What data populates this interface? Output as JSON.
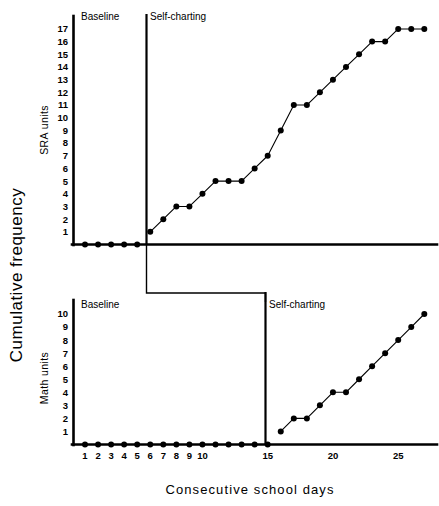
{
  "chart_data": {
    "type": "line",
    "title": "",
    "xlabel": "Consecutive school days",
    "ylabel": "Cumulative frequency",
    "grid": false,
    "legend": "none",
    "design": "multiple-baseline across behaviors (AB design)",
    "xlim": [
      0.3,
      27.8
    ],
    "xticks": [
      1,
      2,
      3,
      4,
      5,
      6,
      7,
      8,
      9,
      10,
      15,
      20,
      25
    ],
    "xticklabels": [
      "1",
      "2",
      "3",
      "4",
      "5",
      "6",
      "7",
      "8",
      "9",
      "10",
      "15",
      "20",
      "25"
    ],
    "panels": [
      {
        "name": "sra",
        "ylabel": "SRA units",
        "ylim": [
          0,
          17.9
        ],
        "yticks": [
          1,
          2,
          3,
          4,
          5,
          6,
          7,
          8,
          9,
          10,
          11,
          12,
          13,
          14,
          15,
          16,
          17
        ],
        "yticklabels": [
          "1",
          "2",
          "3",
          "4",
          "5",
          "6",
          "7",
          "8",
          "9",
          "10",
          "11",
          "12",
          "13",
          "14",
          "15",
          "16",
          "17"
        ],
        "phase_change_day": 5.5,
        "phases": [
          {
            "label": "Baseline",
            "x_text": 6.0
          },
          {
            "label": "Self-charting",
            "x_text": 11.2
          }
        ],
        "series": [
          {
            "name": "Baseline",
            "x": [
              1,
              2,
              3,
              4,
              5
            ],
            "values": [
              0,
              0,
              0,
              0,
              0
            ]
          },
          {
            "name": "Self-charting",
            "x": [
              6,
              7,
              8,
              9,
              10,
              11,
              12,
              13,
              14,
              15,
              16,
              17,
              18,
              19,
              20,
              21,
              22,
              23,
              24,
              25,
              26,
              27
            ],
            "values": [
              1,
              2,
              3,
              3,
              4,
              5,
              5,
              5,
              6,
              7,
              9,
              11,
              11,
              12,
              13,
              14,
              15,
              16,
              16,
              17,
              17,
              17
            ]
          }
        ]
      },
      {
        "name": "math",
        "ylabel": "Math units",
        "ylim": [
          0,
          10.9
        ],
        "yticks": [
          1,
          2,
          3,
          4,
          5,
          6,
          7,
          8,
          9,
          10
        ],
        "yticklabels": [
          "1",
          "2",
          "3",
          "4",
          "5",
          "6",
          "7",
          "8",
          "9",
          "10"
        ],
        "phase_change_day": 15.5,
        "phases": [
          {
            "label": "Baseline",
            "x_text": 1.4
          },
          {
            "label": "Self-charting",
            "x_text": 16.2
          }
        ],
        "series": [
          {
            "name": "Baseline",
            "x": [
              1,
              2,
              3,
              4,
              5,
              6,
              7,
              8,
              9,
              10,
              11,
              12,
              13,
              14,
              15
            ],
            "values": [
              0,
              0,
              0,
              0,
              0,
              0,
              0,
              0,
              0,
              0,
              0,
              0,
              0,
              0,
              0
            ]
          },
          {
            "name": "Self-charting",
            "x": [
              16,
              17,
              18,
              19,
              20,
              21,
              22,
              23,
              24,
              25,
              26,
              27
            ],
            "values": [
              1,
              2,
              2,
              3,
              4,
              4,
              5,
              6,
              7,
              8,
              9,
              10
            ]
          }
        ]
      }
    ],
    "colors": {
      "line": "#000000",
      "marker": "#000000",
      "axis": "#000000",
      "background": "#ffffff"
    }
  },
  "axes": {
    "y_main_title": "Cumulative frequency",
    "x_main_title": "Consecutive school days",
    "top_panel_y_title": "SRA units",
    "bottom_panel_y_title": "Math units"
  },
  "labels": {
    "baseline": "Baseline",
    "self_charting": "Self-charting"
  }
}
